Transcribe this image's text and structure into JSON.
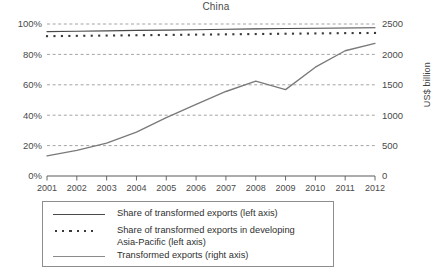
{
  "chart_data": {
    "type": "line",
    "title": "China",
    "xlabel": "",
    "ylabel": "",
    "ylabel_right": "US$ billion",
    "grid": true,
    "legend_position": "below",
    "x": [
      2001,
      2002,
      2003,
      2004,
      2005,
      2006,
      2007,
      2008,
      2009,
      2010,
      2011,
      2012
    ],
    "categories": [
      "2001",
      "2002",
      "2003",
      "2004",
      "2005",
      "2006",
      "2007",
      "2008",
      "2009",
      "2010",
      "2011",
      "2012"
    ],
    "left_axis": {
      "ticks": [
        "0%",
        "20%",
        "40%",
        "60%",
        "80%",
        "100%"
      ],
      "tick_values": [
        0,
        20,
        40,
        60,
        80,
        100
      ],
      "ylim": [
        0,
        100
      ],
      "unit": "%"
    },
    "right_axis": {
      "ticks": [
        "0",
        "500",
        "1000",
        "1500",
        "2000",
        "2500"
      ],
      "tick_values": [
        0,
        500,
        1000,
        1500,
        2000,
        2500
      ],
      "ylim": [
        0,
        2500
      ],
      "label": "US$ billion"
    },
    "series": [
      {
        "name": "Share of transformed exports (left axis)",
        "axis": "left",
        "style": "solid",
        "color": "#4a4a4a",
        "values": [
          95.0,
          95.2,
          95.5,
          95.8,
          96.0,
          96.2,
          96.5,
          96.8,
          97.0,
          97.2,
          97.4,
          97.5
        ]
      },
      {
        "name": "Share of transformed exports in developing Asia-Pacific (left axis)",
        "axis": "left",
        "style": "dotted",
        "color": "#3a3a3a",
        "values": [
          92.0,
          92.2,
          92.4,
          92.6,
          92.8,
          93.0,
          93.2,
          93.4,
          93.6,
          93.8,
          94.0,
          94.1
        ]
      },
      {
        "name": "Transformed exports (right axis)",
        "axis": "right",
        "style": "solid",
        "color": "#7a7a7a",
        "values": [
          330,
          420,
          540,
          720,
          960,
          1180,
          1390,
          1560,
          1420,
          1790,
          2060,
          2180
        ]
      }
    ]
  },
  "legend": {
    "entries": [
      {
        "label": "Share of transformed exports (left axis)",
        "marker": "solid-dark"
      },
      {
        "label": "Share of transformed exports in developing",
        "label2": "Asia-Pacific (left axis)",
        "marker": "dotted-dark"
      },
      {
        "label": "Transformed exports (right axis)",
        "marker": "solid-light"
      }
    ]
  }
}
